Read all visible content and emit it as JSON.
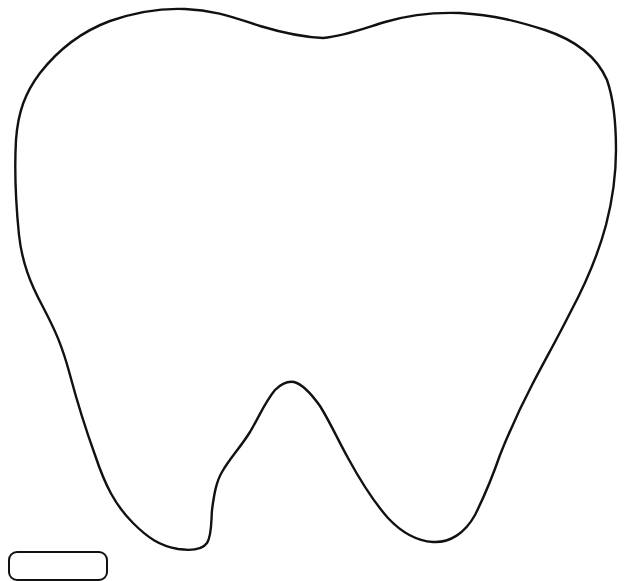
{
  "figure": {
    "background_color": "#ffffff",
    "stroke_color": "#111111",
    "fill": "none"
  },
  "label": {
    "text": "",
    "note_visible": "text cropped at bottom edge; unreadable"
  }
}
